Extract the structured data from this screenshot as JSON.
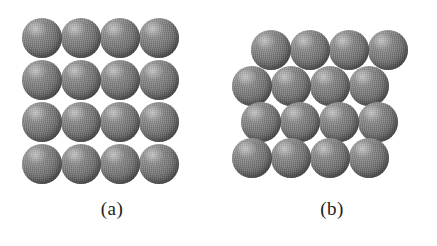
{
  "figure": {
    "background_color": "#ffffff",
    "sphere_color": "#6f6f6f",
    "sphere_highlight_color": "#a8a8a8",
    "sphere_shadow_color": "#484848",
    "panels": [
      {
        "id": "a",
        "label": "(a)",
        "packing": "square",
        "rows": 4,
        "columns": 4,
        "sphere_count": 16,
        "sphere_diameter": 40,
        "origin_x": 22,
        "origin_y": 18,
        "step_x": 39,
        "step_y": 42,
        "row_offsets": [
          0,
          0,
          0,
          0
        ],
        "label_x": 60,
        "label_y": 198,
        "label_width": 104
      },
      {
        "id": "b",
        "label": "(b)",
        "packing": "close-packed-staggered",
        "rows": 4,
        "columns": 4,
        "sphere_count": 16,
        "sphere_diameter": 40,
        "origin_x": 232,
        "origin_y": 30,
        "step_x": 39,
        "step_y": 36,
        "row_offsets": [
          19,
          0,
          9,
          0
        ],
        "label_x": 280,
        "label_y": 198,
        "label_width": 104
      }
    ]
  }
}
